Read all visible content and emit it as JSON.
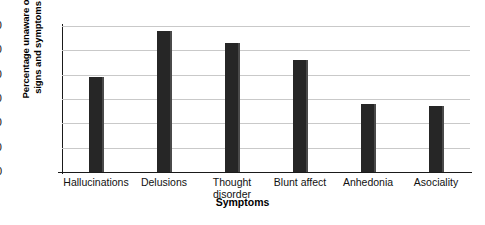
{
  "chart_data": {
    "type": "bar",
    "title": "",
    "xlabel": "Symptoms",
    "ylabel_lines": [
      "Percentage unaware of",
      "signs and symptoms"
    ],
    "ylabel": "Percentage unaware of signs and symptoms",
    "categories": [
      "Hallucinations",
      "Delusions",
      "Thought disorder",
      "Blunt affect",
      "Anhedonia",
      "Asociality"
    ],
    "category_lines": [
      [
        "Hallucinations"
      ],
      [
        "Delusions"
      ],
      [
        "Thought",
        "disorder"
      ],
      [
        "Blunt affect"
      ],
      [
        "Anhedonia"
      ],
      [
        "Asociality"
      ]
    ],
    "values": [
      39,
      58,
      53,
      46,
      28,
      27
    ],
    "ylim": [
      0,
      60
    ],
    "yticks": [
      0,
      10,
      20,
      30,
      40,
      50,
      60
    ],
    "ytick_labels": [
      "0",
      "10",
      "20",
      "30",
      "40",
      "50",
      "60"
    ],
    "grid": true,
    "legend": "none",
    "bar_color": "#262626",
    "grid_color": "#c9c9c9",
    "axis_color": "#1a1a1a",
    "background": "#ffffff"
  }
}
